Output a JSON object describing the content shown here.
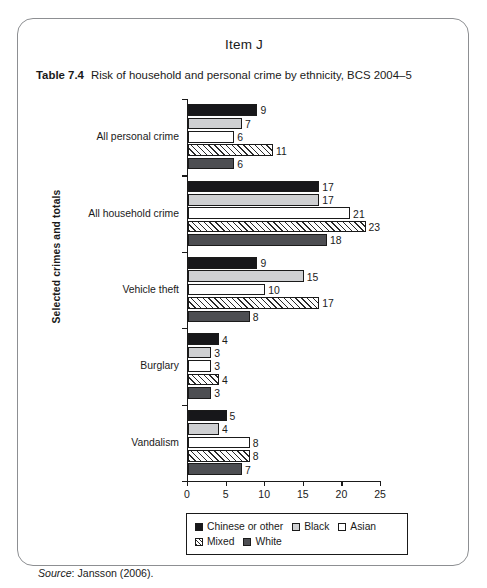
{
  "page": {
    "item_title": "Item J",
    "table_label": "Table 7.4",
    "table_title": "Risk of household and personal crime by ethnicity, BCS 2004–5",
    "source_word": "Source",
    "source_text": ": Jansson (2006)."
  },
  "chart_data": {
    "type": "bar",
    "orientation": "horizontal",
    "title": "Risk of household and personal crime by ethnicity, BCS 2004–5",
    "xlabel": "",
    "ylabel": "Selected crimes and totals",
    "xlim": [
      0,
      25
    ],
    "xticks": [
      0,
      5,
      10,
      15,
      20,
      25
    ],
    "xticklabels": [
      "0",
      "5",
      "10",
      "15",
      "20",
      "25"
    ],
    "grid": false,
    "legend_position": "bottom",
    "categories": [
      "All personal crime",
      "All household crime",
      "Vehicle theft",
      "Burglary",
      "Vandalism"
    ],
    "series": [
      {
        "name": "Chinese or other",
        "color": "#17171a",
        "fill": "solid-black",
        "values": [
          9,
          17,
          9,
          4,
          5
        ]
      },
      {
        "name": "Black",
        "color": "#cfd0d2",
        "fill": "light-gray",
        "values": [
          7,
          17,
          15,
          3,
          4
        ]
      },
      {
        "name": "Asian",
        "color": "#ffffff",
        "fill": "white",
        "values": [
          6,
          21,
          10,
          3,
          8
        ]
      },
      {
        "name": "Mixed",
        "color": "#ffffff",
        "fill": "diagonal-hatch",
        "values": [
          11,
          23,
          17,
          4,
          8
        ]
      },
      {
        "name": "White",
        "color": "#4d4e52",
        "fill": "dark-gray",
        "values": [
          6,
          18,
          8,
          3,
          7
        ]
      }
    ]
  }
}
